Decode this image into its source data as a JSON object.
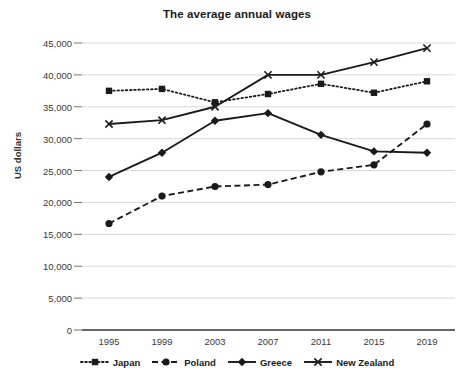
{
  "chart_data": {
    "type": "line",
    "title": "The average annual wages",
    "xlabel": "",
    "ylabel": "US dollars",
    "categories": [
      "1995",
      "1999",
      "2003",
      "2007",
      "2011",
      "2015",
      "2019"
    ],
    "x": [
      1995,
      1999,
      2003,
      2007,
      2011,
      2015,
      2019
    ],
    "ylim": [
      0,
      45000
    ],
    "ytick_labels": [
      "0",
      "5,000",
      "10,000",
      "15,000",
      "20,000",
      "25,000",
      "30,000",
      "35,000",
      "40,000",
      "45,000"
    ],
    "ytick_values": [
      0,
      5000,
      10000,
      15000,
      20000,
      25000,
      30000,
      35000,
      40000,
      45000
    ],
    "grid": true,
    "legend_position": "bottom",
    "series": [
      {
        "name": "Japan",
        "values": [
          37500,
          37800,
          35700,
          37000,
          38600,
          37200,
          39000
        ],
        "line_style": "dotted",
        "marker": "square",
        "color": "#1a1a1a"
      },
      {
        "name": "Poland",
        "values": [
          16700,
          21000,
          22500,
          22800,
          24800,
          25900,
          32300
        ],
        "line_style": "dashed",
        "marker": "circle",
        "color": "#1a1a1a"
      },
      {
        "name": "Greece",
        "values": [
          24000,
          27800,
          32800,
          34000,
          30600,
          28000,
          27800
        ],
        "line_style": "solid",
        "marker": "diamond",
        "color": "#1a1a1a"
      },
      {
        "name": "New Zealand",
        "values": [
          32300,
          32900,
          35000,
          40000,
          40000,
          42000,
          44200
        ],
        "line_style": "solid",
        "marker": "x",
        "color": "#1a1a1a"
      }
    ]
  },
  "legend": {
    "items": [
      {
        "label": "Japan"
      },
      {
        "label": "Poland"
      },
      {
        "label": "Greece"
      },
      {
        "label": "New Zealand"
      }
    ]
  }
}
